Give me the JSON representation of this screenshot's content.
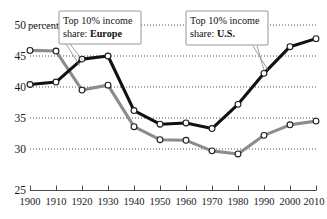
{
  "chart_data": {
    "type": "line",
    "title": "",
    "xlabel": "",
    "ylabel": "percent",
    "unit_label": "50 percent",
    "xlim": [
      1900,
      2010
    ],
    "ylim": [
      25,
      50
    ],
    "grid": true,
    "gridlines": [
      30,
      35,
      40,
      45,
      50
    ],
    "legend_position": "annotations",
    "x": [
      1900,
      1910,
      1920,
      1930,
      1940,
      1950,
      1960,
      1970,
      1980,
      1990,
      2000,
      2010
    ],
    "xtick_labels": [
      "1900",
      "1910",
      "1920",
      "1930",
      "1940",
      "1950",
      "1960",
      "1970",
      "1980",
      "1990",
      "2000",
      "2010"
    ],
    "ytick_labels": [
      "25",
      "30",
      "35",
      "40",
      "45",
      "50"
    ],
    "ytick_values": [
      25,
      30,
      35,
      40,
      45,
      50
    ],
    "series": [
      {
        "name": "Top 10% income share: U.S.",
        "short_name": "U.S.",
        "color": "#111111",
        "values": [
          40.4,
          40.8,
          44.5,
          45.0,
          36.2,
          34.0,
          34.2,
          33.3,
          37.2,
          42.2,
          46.5,
          47.8
        ]
      },
      {
        "name": "Top 10% income share: Europe",
        "short_name": "Europe",
        "color": "#8c8c8c",
        "values": [
          45.9,
          45.8,
          39.5,
          40.3,
          33.6,
          31.5,
          31.4,
          29.7,
          29.2,
          32.2,
          33.9,
          34.5
        ]
      }
    ],
    "annotations": [
      {
        "id": "europe-callout",
        "line1": "Top 10% income",
        "line2_prefix": "share: ",
        "line2_bold": "Europe",
        "points_to_series": "Europe",
        "points_to_x": 1920
      },
      {
        "id": "us-callout",
        "line1": "Top 10% income",
        "line2_prefix": "share: ",
        "line2_bold": "U.S.",
        "points_to_series": "U.S.",
        "points_to_x": 1990
      }
    ]
  }
}
